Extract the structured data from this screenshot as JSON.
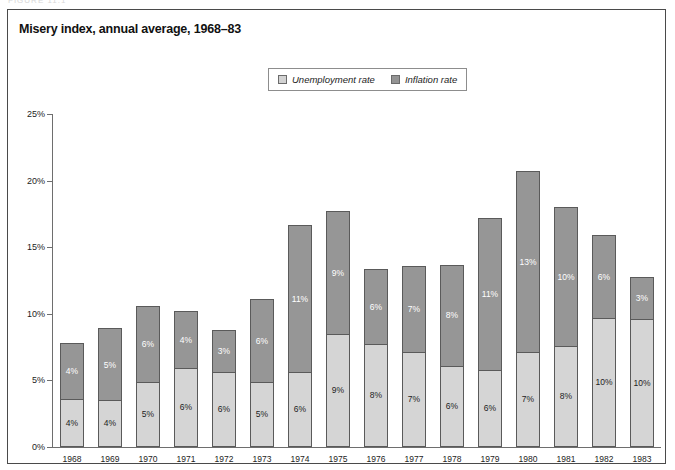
{
  "figure": {
    "caption_ghost": "FIGURE 11.1",
    "title": "Misery index, annual average, 1968–83"
  },
  "legend": {
    "items": [
      {
        "label": "Unemployment rate",
        "swatch": "unemployment-swatch",
        "color": "#d2d2d2"
      },
      {
        "label": "Inflation rate",
        "swatch": "inflation-swatch",
        "color": "#949494"
      }
    ]
  },
  "axis": {
    "y_ticks": [
      "0%",
      "5%",
      "10%",
      "15%",
      "20%",
      "25%"
    ],
    "y_tick_values": [
      0,
      5,
      10,
      15,
      20,
      25
    ]
  },
  "chart_data": {
    "type": "bar",
    "title": "Misery index, annual average, 1968–83",
    "xlabel": "",
    "ylabel": "",
    "ylim": [
      0,
      25
    ],
    "grid": false,
    "stacked": true,
    "legend_position": "top-center",
    "categories": [
      "1968",
      "1969",
      "1970",
      "1971",
      "1972",
      "1973",
      "1974",
      "1975",
      "1976",
      "1977",
      "1978",
      "1979",
      "1980",
      "1981",
      "1982",
      "1983"
    ],
    "series": [
      {
        "name": "Unemployment rate",
        "color": "#d5d5d5",
        "values": [
          3.6,
          3.5,
          4.9,
          5.9,
          5.6,
          4.9,
          5.6,
          8.5,
          7.7,
          7.1,
          6.1,
          5.8,
          7.1,
          7.6,
          9.7,
          9.6
        ],
        "labels": [
          "4%",
          "4%",
          "5%",
          "6%",
          "6%",
          "5%",
          "6%",
          "9%",
          "8%",
          "7%",
          "6%",
          "6%",
          "7%",
          "8%",
          "10%",
          "10%"
        ]
      },
      {
        "name": "Inflation rate",
        "color": "#969696",
        "values": [
          4.2,
          5.4,
          5.7,
          4.3,
          3.2,
          6.2,
          11.1,
          9.2,
          5.7,
          6.5,
          7.6,
          11.4,
          13.6,
          10.4,
          6.2,
          3.2
        ],
        "labels": [
          "4%",
          "5%",
          "6%",
          "4%",
          "3%",
          "6%",
          "11%",
          "9%",
          "6%",
          "7%",
          "8%",
          "11%",
          "13%",
          "10%",
          "6%",
          "3%"
        ]
      }
    ],
    "totals": [
      7.8,
      8.9,
      10.6,
      10.2,
      8.8,
      11.1,
      16.7,
      17.7,
      13.4,
      13.6,
      13.7,
      17.2,
      20.7,
      18.0,
      15.9,
      12.8
    ]
  }
}
